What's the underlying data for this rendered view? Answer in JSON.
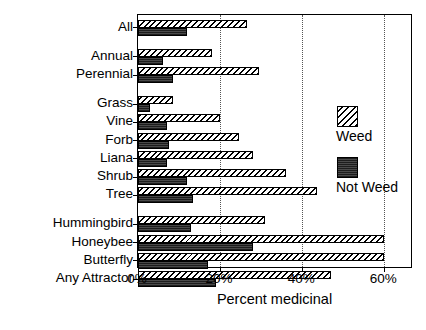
{
  "chart_data": {
    "type": "bar",
    "orientation": "horizontal",
    "title": "",
    "xlabel": "Percent medicinal",
    "ylabel": "",
    "xlim": [
      0,
      67
    ],
    "xticks": [
      0,
      20,
      40,
      60
    ],
    "xtick_labels": [
      "0%",
      "20%",
      "40%",
      "60%"
    ],
    "grid": "vertical-dotted",
    "legend_position": "inside-right",
    "categories": [
      "All",
      "Annual",
      "Perennial",
      "Grass",
      "Vine",
      "Forb",
      "Liana",
      "Shrub",
      "Tree",
      "Hummingbird",
      "Honeybee",
      "Butterfly",
      "Any Attractor"
    ],
    "series": [
      {
        "name": "Weed",
        "pattern": "diagonal-hatch",
        "values": [
          26.5,
          18.0,
          29.5,
          8.5,
          20.0,
          24.5,
          28.0,
          36.0,
          43.5,
          31.0,
          60.0,
          60.0,
          47.0
        ]
      },
      {
        "name": "Not Weed",
        "pattern": "solid-dark",
        "values": [
          12.0,
          6.0,
          8.5,
          3.0,
          7.0,
          7.5,
          7.0,
          12.0,
          13.5,
          13.0,
          28.0,
          17.0,
          19.0
        ]
      }
    ],
    "groups": [
      {
        "name": "overall",
        "categories": [
          "All"
        ]
      },
      {
        "name": "life-history",
        "categories": [
          "Annual",
          "Perennial"
        ]
      },
      {
        "name": "growth-form",
        "categories": [
          "Grass",
          "Vine",
          "Forb",
          "Liana",
          "Shrub",
          "Tree"
        ]
      },
      {
        "name": "pollinator-attractor",
        "categories": [
          "Hummingbird",
          "Honeybee",
          "Butterfly",
          "Any Attractor"
        ]
      }
    ]
  },
  "legend": {
    "entries": [
      {
        "label": "Weed",
        "swatch": "diagonal-hatch"
      },
      {
        "label": "Not Weed",
        "swatch": "solid-dark"
      }
    ]
  },
  "colors": {
    "axis": "#000000",
    "grid": "#555555",
    "weed_fill": "#f2f2f2",
    "not_weed_fill": "#3a3a3a",
    "background": "#ffffff"
  }
}
